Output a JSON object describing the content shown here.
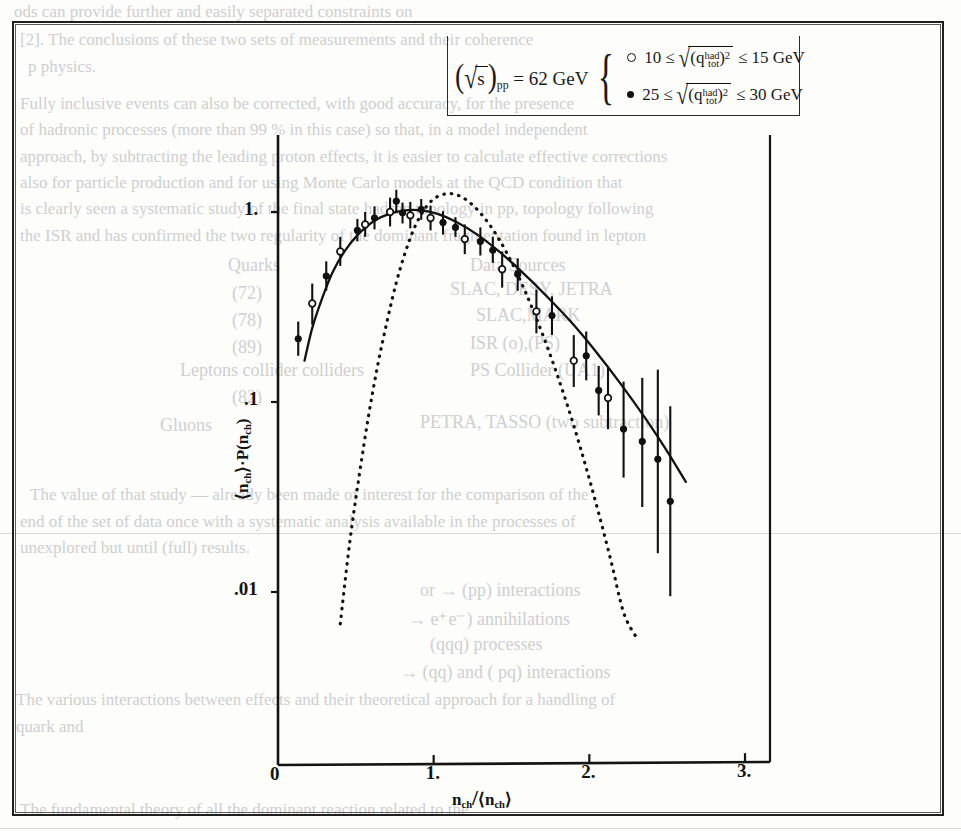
{
  "figure": {
    "kind": "scanned-journal-figure",
    "frame_color": "#1f1f1f"
  },
  "legend": {
    "energy_prefix": "(",
    "sqrt_s": "s",
    "subscript_pp": "pp",
    "energy_text": "= 62 GeV",
    "rows": [
      {
        "marker": "open-circle",
        "low": "10",
        "rel_low": "≤",
        "quantity_base": "q",
        "quantity_sub": "tot",
        "quantity_sup": "had",
        "squared": "2",
        "rel_high": "≤",
        "high": "15 GeV"
      },
      {
        "marker": "filled-circle",
        "low": "25",
        "rel_low": "≤",
        "quantity_base": "q",
        "quantity_sub": "tot",
        "quantity_sup": "had",
        "squared": "2",
        "rel_high": "≤",
        "high": "30 GeV"
      }
    ]
  },
  "chart_data": {
    "type": "scatter",
    "title": "",
    "xlabel": "n_ch/<n_ch>",
    "ylabel": "<n_ch>·P(n_ch)",
    "xlabel_parts": {
      "num": "n",
      "num_sub": "ch",
      "slash": "/",
      "den_open": "⟨",
      "den": "n",
      "den_sub": "ch",
      "den_close": "⟩"
    },
    "ylabel_parts": {
      "open": "⟨",
      "mean": "n",
      "mean_sub": "ch",
      "close": "⟩",
      "dot": "·",
      "p": "P",
      "arg_open": "(",
      "arg": "n",
      "arg_sub": "ch",
      "arg_close": ")"
    },
    "xscale": "linear",
    "yscale": "log",
    "xlim": [
      0,
      3.2
    ],
    "ylim": [
      0.006,
      2.0
    ],
    "xticks": [
      0,
      1,
      2,
      3
    ],
    "xtick_labels": [
      "0",
      "1.",
      "2.",
      "3."
    ],
    "yticks": [
      1,
      0.1,
      0.01
    ],
    "ytick_labels": [
      "1.",
      ".1",
      ".01"
    ],
    "grid": false,
    "legend_position": "top-center",
    "series": [
      {
        "name": "10 ≤ sqrt((q_tot^had)^2) ≤ 15 GeV",
        "marker": "open-circle",
        "points": [
          {
            "x": 0.22,
            "y": 0.33,
            "ylo": 0.255,
            "yhi": 0.42
          },
          {
            "x": 0.4,
            "y": 0.62,
            "ylo": 0.52,
            "yhi": 0.74
          },
          {
            "x": 0.56,
            "y": 0.86,
            "ylo": 0.74,
            "yhi": 1.0
          },
          {
            "x": 0.72,
            "y": 1.0,
            "ylo": 0.84,
            "yhi": 1.19
          },
          {
            "x": 0.85,
            "y": 0.96,
            "ylo": 0.82,
            "yhi": 1.13
          },
          {
            "x": 0.98,
            "y": 0.93,
            "ylo": 0.8,
            "yhi": 1.08
          },
          {
            "x": 1.2,
            "y": 0.72,
            "ylo": 0.6,
            "yhi": 0.86
          },
          {
            "x": 1.44,
            "y": 0.5,
            "ylo": 0.4,
            "yhi": 0.62
          },
          {
            "x": 1.66,
            "y": 0.3,
            "ylo": 0.23,
            "yhi": 0.39
          },
          {
            "x": 1.9,
            "y": 0.165,
            "ylo": 0.12,
            "yhi": 0.225
          },
          {
            "x": 2.12,
            "y": 0.105,
            "ylo": 0.072,
            "yhi": 0.152
          }
        ]
      },
      {
        "name": "25 ≤ sqrt((q_tot^had)^2) ≤ 30 GeV",
        "marker": "filled-circle",
        "points": [
          {
            "x": 0.13,
            "y": 0.215,
            "ylo": 0.175,
            "yhi": 0.265
          },
          {
            "x": 0.31,
            "y": 0.46,
            "ylo": 0.385,
            "yhi": 0.55
          },
          {
            "x": 0.51,
            "y": 0.8,
            "ylo": 0.7,
            "yhi": 0.92
          },
          {
            "x": 0.62,
            "y": 0.93,
            "ylo": 0.81,
            "yhi": 1.07
          },
          {
            "x": 0.76,
            "y": 1.14,
            "ylo": 0.99,
            "yhi": 1.31
          },
          {
            "x": 0.8,
            "y": 0.99,
            "ylo": 0.87,
            "yhi": 1.12
          },
          {
            "x": 0.92,
            "y": 1.03,
            "ylo": 0.91,
            "yhi": 1.17
          },
          {
            "x": 1.06,
            "y": 0.88,
            "ylo": 0.76,
            "yhi": 1.01
          },
          {
            "x": 1.14,
            "y": 0.83,
            "ylo": 0.74,
            "yhi": 0.94
          },
          {
            "x": 1.3,
            "y": 0.7,
            "ylo": 0.59,
            "yhi": 0.83
          },
          {
            "x": 1.38,
            "y": 0.63,
            "ylo": 0.54,
            "yhi": 0.74
          },
          {
            "x": 1.54,
            "y": 0.47,
            "ylo": 0.385,
            "yhi": 0.57
          },
          {
            "x": 1.76,
            "y": 0.285,
            "ylo": 0.225,
            "yhi": 0.36
          },
          {
            "x": 1.98,
            "y": 0.175,
            "ylo": 0.13,
            "yhi": 0.235
          },
          {
            "x": 2.06,
            "y": 0.115,
            "ylo": 0.085,
            "yhi": 0.155
          },
          {
            "x": 2.22,
            "y": 0.072,
            "ylo": 0.04,
            "yhi": 0.128
          },
          {
            "x": 2.34,
            "y": 0.062,
            "ylo": 0.028,
            "yhi": 0.134
          },
          {
            "x": 2.44,
            "y": 0.05,
            "ylo": 0.016,
            "yhi": 0.148
          },
          {
            "x": 2.52,
            "y": 0.03,
            "ylo": 0.0095,
            "yhi": 0.095
          }
        ]
      }
    ],
    "curves": [
      {
        "name": "KNO fit",
        "style": "solid",
        "points": [
          {
            "x": 0.17,
            "y": 0.165
          },
          {
            "x": 0.22,
            "y": 0.245
          },
          {
            "x": 0.28,
            "y": 0.345
          },
          {
            "x": 0.35,
            "y": 0.48
          },
          {
            "x": 0.43,
            "y": 0.625
          },
          {
            "x": 0.52,
            "y": 0.77
          },
          {
            "x": 0.62,
            "y": 0.9
          },
          {
            "x": 0.72,
            "y": 0.98
          },
          {
            "x": 0.82,
            "y": 1.02
          },
          {
            "x": 0.92,
            "y": 1.02
          },
          {
            "x": 1.02,
            "y": 0.98
          },
          {
            "x": 1.14,
            "y": 0.89
          },
          {
            "x": 1.28,
            "y": 0.76
          },
          {
            "x": 1.42,
            "y": 0.62
          },
          {
            "x": 1.56,
            "y": 0.49
          },
          {
            "x": 1.72,
            "y": 0.365
          },
          {
            "x": 1.88,
            "y": 0.265
          },
          {
            "x": 2.04,
            "y": 0.185
          },
          {
            "x": 2.2,
            "y": 0.125
          },
          {
            "x": 2.36,
            "y": 0.082
          },
          {
            "x": 2.5,
            "y": 0.055
          },
          {
            "x": 2.62,
            "y": 0.038
          }
        ]
      },
      {
        "name": "Poisson",
        "style": "dotted",
        "points": [
          {
            "x": 0.4,
            "y": 0.0068
          },
          {
            "x": 0.46,
            "y": 0.018
          },
          {
            "x": 0.52,
            "y": 0.04
          },
          {
            "x": 0.58,
            "y": 0.083
          },
          {
            "x": 0.64,
            "y": 0.155
          },
          {
            "x": 0.7,
            "y": 0.265
          },
          {
            "x": 0.76,
            "y": 0.425
          },
          {
            "x": 0.82,
            "y": 0.62
          },
          {
            "x": 0.88,
            "y": 0.84
          },
          {
            "x": 0.95,
            "y": 1.06
          },
          {
            "x": 1.02,
            "y": 1.2
          },
          {
            "x": 1.1,
            "y": 1.25
          },
          {
            "x": 1.18,
            "y": 1.2
          },
          {
            "x": 1.26,
            "y": 1.07
          },
          {
            "x": 1.34,
            "y": 0.9
          },
          {
            "x": 1.42,
            "y": 0.72
          },
          {
            "x": 1.5,
            "y": 0.545
          },
          {
            "x": 1.58,
            "y": 0.395
          },
          {
            "x": 1.66,
            "y": 0.275
          },
          {
            "x": 1.74,
            "y": 0.185
          },
          {
            "x": 1.82,
            "y": 0.12
          },
          {
            "x": 1.9,
            "y": 0.075
          },
          {
            "x": 1.98,
            "y": 0.045
          },
          {
            "x": 2.06,
            "y": 0.026
          },
          {
            "x": 2.14,
            "y": 0.0145
          },
          {
            "x": 2.22,
            "y": 0.0078
          },
          {
            "x": 2.3,
            "y": 0.0058
          }
        ]
      }
    ]
  },
  "ghost_text": {
    "lines": [
      {
        "t": "ods can provide further and easily separated constraints on",
        "x": 14,
        "y": 2,
        "s": 17
      },
      {
        "t": "[2]. The conclusions of these two sets of measurements and their coherence",
        "x": 20,
        "y": 30,
        "s": 17
      },
      {
        "t": "p physics.",
        "x": 28,
        "y": 57,
        "s": 17
      },
      {
        "t": "Fully inclusive events can also be corrected, with good accuracy, for the presence",
        "x": 20,
        "y": 94,
        "s": 17
      },
      {
        "t": "of hadronic processes (more than 99 % in this case) so that, in a model independent",
        "x": 20,
        "y": 120,
        "s": 17
      },
      {
        "t": "approach, by subtracting the leading proton effects, it is easier to calculate effective corrections",
        "x": 20,
        "y": 147,
        "s": 17
      },
      {
        "t": "also for particle production and for using Monte Carlo models at the QCD condition that",
        "x": 20,
        "y": 173,
        "s": 17
      },
      {
        "t": "is clearly seen a systematic study of the final state hadron topology in pp, topology following",
        "x": 20,
        "y": 199,
        "s": 17
      },
      {
        "t": "the ISR and has confirmed the two regularity of the dominant fragmentation found in lepton",
        "x": 20,
        "y": 226,
        "s": 17
      },
      {
        "t": "Quarks",
        "x": 228,
        "y": 255,
        "s": 18
      },
      {
        "t": "Data Sources",
        "x": 470,
        "y": 255,
        "s": 18
      },
      {
        "t": "(72)",
        "x": 232,
        "y": 283,
        "s": 18
      },
      {
        "t": "SLAC, DESY, JETRA",
        "x": 450,
        "y": 279,
        "s": 18
      },
      {
        "t": "(78)",
        "x": 232,
        "y": 310,
        "s": 18
      },
      {
        "t": "SLAC,MARK",
        "x": 476,
        "y": 305,
        "s": 18
      },
      {
        "t": "(89)",
        "x": 232,
        "y": 337,
        "s": 18
      },
      {
        "t": "ISR (o),(PS)",
        "x": 470,
        "y": 333,
        "s": 18
      },
      {
        "t": "Leptons collider colliders",
        "x": 180,
        "y": 360,
        "s": 18
      },
      {
        "t": "PS Collider (UA1)",
        "x": 470,
        "y": 360,
        "s": 18
      },
      {
        "t": "(82)",
        "x": 232,
        "y": 387,
        "s": 18
      },
      {
        "t": "Gluons",
        "x": 160,
        "y": 415,
        "s": 18
      },
      {
        "t": "PETRA, TASSO (two subtraction)",
        "x": 420,
        "y": 412,
        "s": 18
      },
      {
        "t": "The value of that study — already been made of interest for the comparison of the",
        "x": 30,
        "y": 485,
        "s": 17
      },
      {
        "t": "end of the set of data once with a systematic analysis available in the processes of",
        "x": 20,
        "y": 512,
        "s": 17
      },
      {
        "t": "unexplored but until (full) results.",
        "x": 20,
        "y": 538,
        "s": 17
      },
      {
        "t": "or → (pp) interactions",
        "x": 420,
        "y": 580,
        "s": 18
      },
      {
        "t": "→ e⁺e⁻) annihilations",
        "x": 408,
        "y": 608,
        "s": 18
      },
      {
        "t": "(qqq) processes",
        "x": 430,
        "y": 634,
        "s": 18
      },
      {
        "t": "→ (qq) and ( pq) interactions",
        "x": 400,
        "y": 662,
        "s": 18
      },
      {
        "t": "The various interactions between effects and their theoretical approach for a handling of",
        "x": 16,
        "y": 690,
        "s": 17
      },
      {
        "t": "quark and",
        "x": 16,
        "y": 717,
        "s": 17
      },
      {
        "t": "The fundamental theory of all the dominant reaction related to the",
        "x": 20,
        "y": 800,
        "s": 17
      }
    ]
  }
}
